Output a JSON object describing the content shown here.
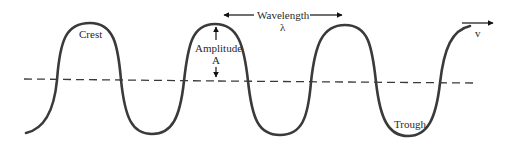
{
  "diagram": {
    "type": "transverse-wave",
    "labels": {
      "crest": "Crest",
      "trough": "Trough",
      "amplitude": "Amplitude",
      "amplitude_symbol": "A",
      "wavelength": "Wavelength",
      "wavelength_symbol": "λ",
      "velocity_symbol": "v"
    },
    "colors": {
      "wave": "#3a3a3a",
      "axis": "#3a3a3a",
      "arrows": "#111111",
      "text": "#2a2a2a"
    }
  }
}
